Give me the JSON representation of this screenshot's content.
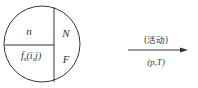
{
  "diagram": {
    "circle": {
      "regions": {
        "top_left": "n",
        "bottom_left_main": "f",
        "bottom_left_sub": "s",
        "bottom_left_args": "(i,j)",
        "right_top": "N",
        "right_bottom": "F"
      }
    },
    "arrow": {
      "label_top": "(活动)",
      "label_bottom": "(p,T)"
    },
    "colors": {
      "stroke": "#333333",
      "background": "#ffffff"
    }
  }
}
